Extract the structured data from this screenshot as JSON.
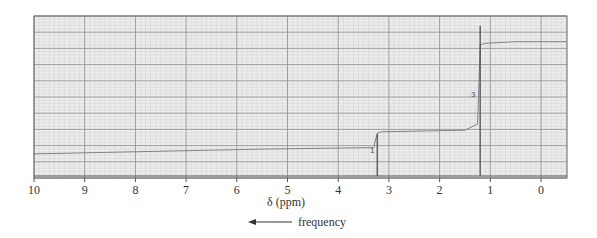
{
  "chart_data": {
    "type": "line",
    "title": "",
    "xlabel": "δ (ppm)",
    "ylabel": "",
    "xlim": [
      10,
      -0.5
    ],
    "x_reversed": true,
    "x_ticks": [
      10,
      9,
      8,
      7,
      6,
      5,
      4,
      3,
      2,
      1,
      0
    ],
    "grid": true,
    "annotation": "frequency",
    "annotation_arrow": "left",
    "peaks": [
      {
        "shift_ppm": 3.23,
        "relative_height": 0.27,
        "integration": "1"
      },
      {
        "shift_ppm": 1.2,
        "relative_height": 0.97,
        "integration": "3"
      }
    ],
    "integration_curve": {
      "x": [
        10,
        5.5,
        3.3,
        3.23,
        3.15,
        1.5,
        1.25,
        1.2,
        1.1,
        0.5,
        -0.5
      ],
      "y": [
        0.14,
        0.17,
        0.18,
        0.27,
        0.28,
        0.29,
        0.33,
        0.83,
        0.84,
        0.85,
        0.85
      ]
    }
  },
  "labels": {
    "x_title": "δ (ppm)",
    "frequency": "frequency",
    "integ_1": "1",
    "integ_3": "3"
  },
  "colors": {
    "grid_minor": "#cfcfcf",
    "grid_major": "#8a8a8a",
    "plot_bg": "#ececec",
    "trace": "#555555"
  }
}
